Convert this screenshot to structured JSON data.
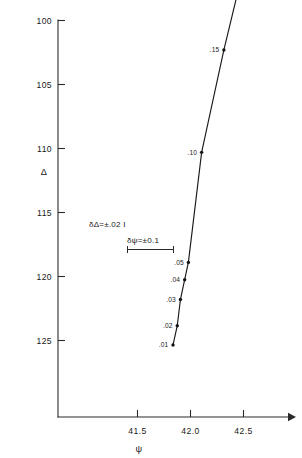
{
  "chart_data": {
    "type": "line",
    "title": "",
    "subtitle": "",
    "xlabel": "ψ",
    "ylabel": "Δ",
    "xlim": [
      41.25,
      42.75
    ],
    "ylim": [
      126.5,
      99.0
    ],
    "y_axis_inverted": true,
    "grid": false,
    "legend": null,
    "x_ticks": [
      "41.5",
      "42.0",
      "42.5"
    ],
    "x_tick_values": [
      41.5,
      42.0,
      42.5
    ],
    "y_ticks": [
      "100",
      "105",
      "110",
      "115",
      "120",
      "125"
    ],
    "y_tick_values": [
      100,
      105,
      110,
      115,
      120,
      125
    ],
    "series": [
      {
        "name": "film thickness",
        "point_label_meaning": "thickness parameter",
        "points": [
          {
            "label": ".01",
            "x": 41.835,
            "y": 125.35
          },
          {
            "label": ".02",
            "x": 41.875,
            "y": 123.85
          },
          {
            "label": ".03",
            "x": 41.905,
            "y": 121.8
          },
          {
            "label": ".04",
            "x": 41.945,
            "y": 120.25
          },
          {
            "label": ".05",
            "x": 41.98,
            "y": 118.9
          },
          {
            "label": ".10",
            "x": 42.105,
            "y": 110.3
          },
          {
            "label": ".15",
            "x": 42.315,
            "y": 102.3
          },
          {
            "label": ".20",
            "x": 42.52,
            "y": 95.25
          }
        ]
      }
    ],
    "annotations": [
      {
        "name": "delta-uncertainty",
        "text": "δΔ=±.02 I"
      },
      {
        "name": "psi-uncertainty",
        "text": "δψ=±0.1"
      }
    ]
  }
}
